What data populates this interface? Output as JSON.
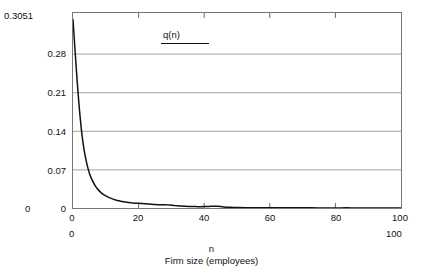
{
  "chart_data": {
    "type": "line",
    "title": "",
    "xlabel": "Firm size (employees)",
    "xlabel_symbol": "n",
    "ylabel": "",
    "xlim": [
      0,
      100
    ],
    "ylim": [
      0,
      0.3051
    ],
    "grid": true,
    "legend_position": "top-left-inside",
    "y_range_max_label": "0.3051",
    "y_range_min_label": "0",
    "x_range_min_label": "0",
    "x_range_max_label": "100",
    "yticks": [
      0.28,
      0.21,
      0.14,
      0.07,
      0
    ],
    "ytick_labels": [
      "0.28",
      "0.21",
      "0.14",
      "0.07",
      "0"
    ],
    "xticks": [
      0,
      20,
      40,
      60,
      80,
      100
    ],
    "xtick_labels": [
      "0",
      "20",
      "40",
      "60",
      "80",
      "100"
    ],
    "series": [
      {
        "name": "q(n)",
        "color": "#111111",
        "x": [
          0,
          1,
          2,
          3,
          4,
          5,
          6,
          7,
          8,
          9,
          10,
          11,
          12,
          13,
          14,
          15,
          16,
          17,
          18,
          19,
          20,
          21,
          22,
          23,
          24,
          25,
          26,
          27,
          28,
          29,
          30,
          31,
          32,
          33,
          34,
          35,
          36,
          37,
          38,
          39,
          40,
          41,
          42,
          43,
          44,
          45,
          46,
          47,
          48,
          49,
          50,
          55,
          60,
          65,
          70,
          75,
          80,
          85,
          90,
          95,
          100
        ],
        "values": [
          0.295,
          0.218,
          0.152,
          0.104,
          0.074,
          0.0545,
          0.042,
          0.033,
          0.0268,
          0.0222,
          0.0188,
          0.0162,
          0.0142,
          0.0126,
          0.0113,
          0.0102,
          0.0093,
          0.0086,
          0.008,
          0.0075,
          0.0074,
          0.0072,
          0.0068,
          0.0063,
          0.0058,
          0.0054,
          0.0051,
          0.005,
          0.0052,
          0.0049,
          0.0043,
          0.0038,
          0.0034,
          0.003,
          0.0027,
          0.0025,
          0.0023,
          0.0022,
          0.0021,
          0.0021,
          0.0022,
          0.0024,
          0.0026,
          0.0027,
          0.0026,
          0.0022,
          0.0017,
          0.0013,
          0.001,
          0.0008,
          0.0007,
          0.0005,
          0.0004,
          0.0003,
          0.0003,
          0.0002,
          0.0002,
          0.0002,
          0.0001,
          0.0001,
          0.0001
        ]
      }
    ]
  },
  "legend": {
    "label": "q(n)"
  },
  "axes": {
    "x_title_symbol": "n",
    "x_title_text": "Firm size (employees)"
  },
  "colors": {
    "curve": "#111111",
    "gridline": "#8a8a8a",
    "frame": "#777777",
    "text": "#111111",
    "background": "#ffffff"
  }
}
